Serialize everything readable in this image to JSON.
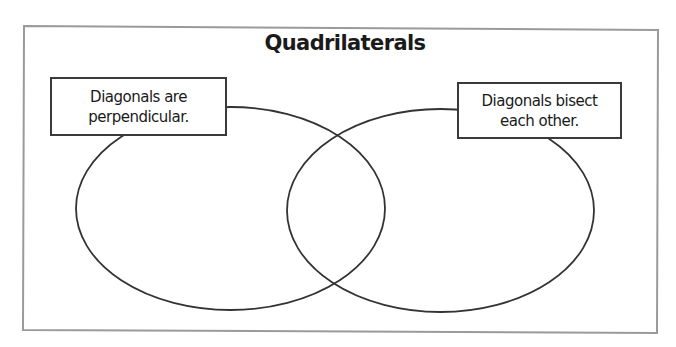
{
  "diagram": {
    "type": "venn",
    "title": "Quadrilaterals",
    "sets": [
      {
        "id": "left",
        "label_lines": [
          "Diagonals are",
          "perpendicular."
        ],
        "label": "Diagonals are perpendicular.",
        "ellipse": {
          "cx": 230.5,
          "cy": 208.5,
          "rx": 154.5,
          "ry": 101.5
        }
      },
      {
        "id": "right",
        "label_lines": [
          "Diagonals bisect",
          "each other."
        ],
        "label": "Diagonals bisect each other.",
        "ellipse": {
          "cx": 440.5,
          "cy": 210.5,
          "rx": 153.5,
          "ry": 101.5
        }
      }
    ],
    "region_contents": {
      "left_only": [],
      "intersection": [],
      "right_only": [],
      "outside": []
    },
    "colors": {
      "frame": "#9a9a9a",
      "ellipse_stroke": "#333333",
      "label_border": "#3a3a3a",
      "text": "#1a1a1a",
      "background": "#ffffff"
    }
  }
}
